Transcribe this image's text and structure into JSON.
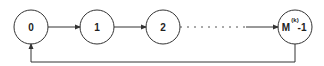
{
  "diagram": {
    "type": "state-transition-cycle",
    "nodes": [
      {
        "id": "s0",
        "label": "0"
      },
      {
        "id": "s1",
        "label": "1"
      },
      {
        "id": "s2",
        "label": "2"
      },
      {
        "id": "slast",
        "label_base": "M",
        "label_sup": "(k)",
        "label_suffix": " -1"
      }
    ],
    "edges": [
      {
        "from": "s0",
        "to": "s1",
        "style": "solid"
      },
      {
        "from": "s1",
        "to": "s2",
        "style": "solid"
      },
      {
        "from": "s2",
        "to": "slast",
        "style": "dashed-then-solid"
      },
      {
        "from": "slast",
        "to": "s0",
        "style": "solid",
        "route": "feedback-below"
      }
    ],
    "colors": {
      "stroke": "#333333",
      "background": "#ffffff"
    }
  }
}
